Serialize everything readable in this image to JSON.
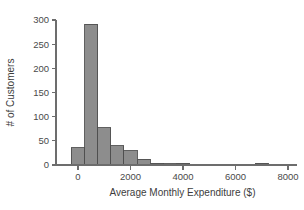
{
  "chart_data": {
    "type": "bar",
    "title": "",
    "subtitle": "",
    "xlabel": "Average Monthly Expenditure ($)",
    "ylabel": "# of Customers",
    "xlim": [
      -600,
      8400
    ],
    "ylim": [
      0,
      300
    ],
    "grid": false,
    "legend": null,
    "bin_width": 500,
    "bar_color": "#8d8d8d",
    "bar_edge_color": "#4f4f4f",
    "axis_color": "#6d6d6d",
    "xticks": [
      0,
      2000,
      4000,
      6000,
      8000
    ],
    "xtick_labels": [
      "0",
      "2000",
      "4000",
      "6000",
      "8000"
    ],
    "yticks": [
      0,
      50,
      100,
      150,
      200,
      250,
      300
    ],
    "ytick_labels": [
      "0",
      "50",
      "100",
      "150",
      "200",
      "250",
      "300"
    ],
    "bins": [
      {
        "left": -250,
        "right": 250,
        "value": 36
      },
      {
        "left": 250,
        "right": 750,
        "value": 291
      },
      {
        "left": 750,
        "right": 1250,
        "value": 77
      },
      {
        "left": 1250,
        "right": 1750,
        "value": 40
      },
      {
        "left": 1750,
        "right": 2250,
        "value": 29
      },
      {
        "left": 2250,
        "right": 2750,
        "value": 12
      },
      {
        "left": 2750,
        "right": 3250,
        "value": 4
      },
      {
        "left": 3250,
        "right": 3750,
        "value": 3
      },
      {
        "left": 3750,
        "right": 4250,
        "value": 4
      },
      {
        "left": 4250,
        "right": 4750,
        "value": 1
      },
      {
        "left": 6750,
        "right": 7250,
        "value": 4
      }
    ],
    "categories": [
      "0",
      "500",
      "1000",
      "1500",
      "2000",
      "2500",
      "3000",
      "3500",
      "4000",
      "4500",
      "7000"
    ],
    "values": [
      36,
      291,
      77,
      40,
      29,
      12,
      4,
      3,
      4,
      1,
      4
    ]
  }
}
